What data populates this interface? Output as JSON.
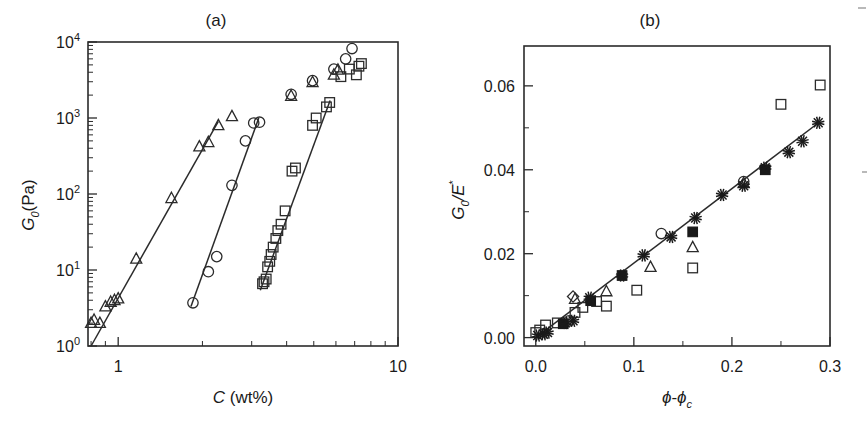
{
  "figure": {
    "title_a": "(a)",
    "title_b": "(b)",
    "background": "#ffffff",
    "ink": "#1a1a1a"
  },
  "chart_data": [
    {
      "id": "panel-a",
      "type": "scatter",
      "title": "(a)",
      "xlabel": "C (wt%)",
      "ylabel": "G0(Pa)",
      "xscale": "log",
      "yscale": "log",
      "xlim": [
        0.78,
        10.0
      ],
      "ylim": [
        1.0,
        10000.0
      ],
      "xticks": [
        1,
        10
      ],
      "xticklabels": [
        "1",
        "10"
      ],
      "yticks": [
        1,
        10,
        100,
        1000,
        10000
      ],
      "yticklabels": [
        "10^0",
        "10^1",
        "10^2",
        "10^3",
        "10^4"
      ],
      "grid": false,
      "legend": "none",
      "series": [
        {
          "name": "triangle-series",
          "marker": "triangle-open",
          "x": [
            0.8,
            0.82,
            0.86,
            0.9,
            0.94,
            0.97,
            1.0,
            1.16,
            1.55,
            1.95,
            2.1,
            2.28,
            2.55
          ],
          "y": [
            2.0,
            2.2,
            2.0,
            3.3,
            3.8,
            4.0,
            4.2,
            14.0,
            88.0,
            420.0,
            480.0,
            800.0,
            1050.0
          ]
        },
        {
          "name": "circle-series",
          "marker": "circle-open",
          "x": [
            1.85,
            2.1,
            2.25,
            2.55,
            2.85,
            3.05,
            3.2
          ],
          "y": [
            3.7,
            9.5,
            15.0,
            130.0,
            500.0,
            860.0,
            880.0
          ]
        },
        {
          "name": "square-series",
          "marker": "square-open",
          "x": [
            3.28,
            3.32,
            3.38,
            3.42,
            3.48,
            3.52,
            3.58,
            3.66,
            3.72,
            3.82,
            3.95,
            4.18,
            4.3,
            4.95,
            5.1,
            5.55,
            5.7
          ],
          "y": [
            6.6,
            7.0,
            7.6,
            11.0,
            13.0,
            16.0,
            20.0,
            26.0,
            33.0,
            40.0,
            60.0,
            200.0,
            220.0,
            800.0,
            1000.0,
            1400.0,
            1600.0
          ]
        },
        {
          "name": "upper-circle-series",
          "marker": "circle-open",
          "x": [
            4.15,
            4.95,
            5.9,
            6.5,
            6.85
          ],
          "y": [
            2050.0,
            3100.0,
            4400.0,
            6000.0,
            8200.0
          ]
        },
        {
          "name": "upper-triangle-series",
          "marker": "triangle-open",
          "x": [
            4.15,
            4.95,
            5.9,
            6.1
          ],
          "y": [
            1950.0,
            2950.0,
            3700.0,
            4300.0
          ]
        },
        {
          "name": "upper-square-series",
          "marker": "square-open",
          "x": [
            6.25,
            6.7,
            7.1,
            7.25,
            7.4
          ],
          "y": [
            3500.0,
            4400.0,
            3700.0,
            4800.0,
            5200.0
          ]
        }
      ],
      "fit_lines": [
        {
          "name": "fit-triangle",
          "x": [
            0.8,
            2.28
          ],
          "y": [
            1.0,
            900.0
          ]
        },
        {
          "name": "fit-circle",
          "x": [
            1.82,
            3.18
          ],
          "y": [
            3.3,
            1000.0
          ]
        },
        {
          "name": "fit-square",
          "x": [
            3.22,
            5.72
          ],
          "y": [
            5.4,
            1700.0
          ]
        }
      ]
    },
    {
      "id": "panel-b",
      "type": "scatter",
      "title": "(b)",
      "xlabel": "phi-phi_c",
      "ylabel": "G0/E*",
      "xscale": "linear",
      "yscale": "linear",
      "xlim": [
        -0.012,
        0.3
      ],
      "ylim": [
        -0.002,
        0.0695
      ],
      "xticks": [
        0.0,
        0.1,
        0.2,
        0.3
      ],
      "xticklabels": [
        "0.0",
        "0.1",
        "0.2",
        "0.3"
      ],
      "xminorticks": [
        0.05,
        0.15,
        0.25
      ],
      "yticks": [
        0.0,
        0.02,
        0.04,
        0.06
      ],
      "yticklabels": [
        "0.00",
        "0.02",
        "0.04",
        "0.06"
      ],
      "yminorticks": [
        0.01,
        0.03,
        0.05
      ],
      "grid": false,
      "legend": "none",
      "series": [
        {
          "name": "asterisk-series",
          "marker": "asterisk",
          "x": [
            0.002,
            0.008,
            0.012,
            0.03,
            0.038,
            0.055,
            0.088,
            0.11,
            0.138,
            0.163,
            0.19,
            0.212,
            0.234,
            0.258,
            0.272,
            0.288
          ],
          "y": [
            0.0005,
            0.0008,
            0.0012,
            0.0035,
            0.004,
            0.0095,
            0.0148,
            0.0196,
            0.024,
            0.0285,
            0.034,
            0.0362,
            0.0405,
            0.0442,
            0.0468,
            0.0512
          ]
        },
        {
          "name": "filled-square-series",
          "marker": "square-filled",
          "x": [
            0.028,
            0.056,
            0.088,
            0.16,
            0.234
          ],
          "y": [
            0.0033,
            0.0088,
            0.0148,
            0.0252,
            0.04
          ]
        },
        {
          "name": "open-square-series",
          "marker": "square-open",
          "x": [
            0.0,
            0.004,
            0.01,
            0.022,
            0.04,
            0.048,
            0.062,
            0.072,
            0.103,
            0.16,
            0.25,
            0.29
          ],
          "y": [
            0.0012,
            0.0018,
            0.003,
            0.0035,
            0.006,
            0.0072,
            0.0086,
            0.0075,
            0.0113,
            0.0166,
            0.0556,
            0.0602
          ]
        },
        {
          "name": "open-triangle-series",
          "marker": "triangle-open",
          "x": [
            0.04,
            0.072,
            0.117,
            0.16,
            0.212
          ],
          "y": [
            0.0092,
            0.011,
            0.0168,
            0.0215,
            0.0368
          ]
        },
        {
          "name": "open-circle-series",
          "marker": "circle-open",
          "x": [
            0.034,
            0.128,
            0.212
          ],
          "y": [
            0.004,
            0.0248,
            0.0372
          ]
        },
        {
          "name": "open-diamond-series",
          "marker": "diamond-open",
          "x": [
            0.038
          ],
          "y": [
            0.0098
          ]
        }
      ],
      "fit_lines": [
        {
          "name": "fit-master",
          "x": [
            0.0,
            0.29
          ],
          "y": [
            0.0,
            0.0515
          ]
        }
      ]
    }
  ]
}
